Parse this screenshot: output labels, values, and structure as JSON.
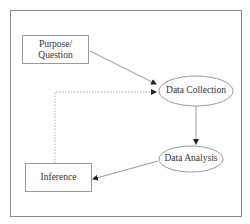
{
  "diagram": {
    "nodes": {
      "purpose": {
        "label_line1": "Purpose/",
        "label_line2": "Question",
        "shape": "rectangle"
      },
      "collection": {
        "label": "Data Collection",
        "shape": "ellipse"
      },
      "analysis": {
        "label": "Data Analysis",
        "shape": "ellipse"
      },
      "inference": {
        "label": "Inference",
        "shape": "rectangle"
      }
    },
    "edges": [
      {
        "from": "Purpose/Question",
        "to": "Data Collection",
        "style": "solid"
      },
      {
        "from": "Data Collection",
        "to": "Data Analysis",
        "style": "solid"
      },
      {
        "from": "Data Analysis",
        "to": "Inference",
        "style": "solid"
      },
      {
        "from": "Inference",
        "to": "Data Collection",
        "style": "dotted"
      }
    ],
    "colors": {
      "stroke": "#8a8a8a",
      "text": "#333333"
    }
  }
}
